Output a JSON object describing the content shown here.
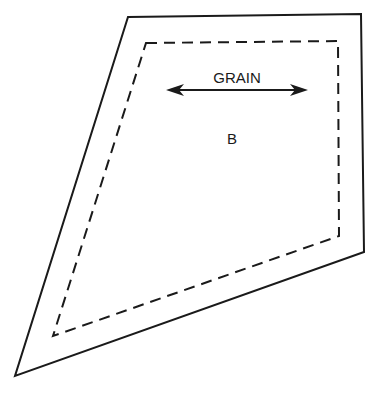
{
  "diagram": {
    "grain_label": "GRAIN",
    "piece_label": "B",
    "colors": {
      "stroke": "#1a1a1a",
      "background": "#ffffff"
    },
    "outer_outline": [
      [
        128,
        17
      ],
      [
        361,
        14
      ],
      [
        364,
        252
      ],
      [
        15,
        376
      ]
    ],
    "seam_line": [
      [
        146,
        43
      ],
      [
        338,
        41
      ],
      [
        339,
        236
      ],
      [
        53,
        336
      ]
    ],
    "grain_arrow": {
      "x1": 167,
      "x2": 307,
      "y": 90
    }
  }
}
